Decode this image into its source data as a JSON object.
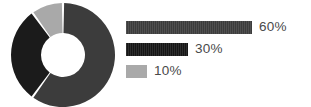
{
  "chart_data": {
    "type": "pie",
    "variant": "donut",
    "title": "",
    "subtitle": "",
    "xlabel": "",
    "ylabel": "",
    "grid": false,
    "legend_position": "right",
    "legend_style": "proportional-bars",
    "categories": [
      "60%",
      "30%",
      "10%"
    ],
    "values": [
      60,
      30,
      10
    ],
    "labels": [
      "60%",
      "30%",
      "10%"
    ],
    "slices": [
      {
        "label": "60%",
        "value": 60,
        "color": "#3c3c3c",
        "start_angle": 0,
        "end_angle": 216
      },
      {
        "label": "30%",
        "value": 30,
        "color": "#1b1b1b",
        "start_angle": 216,
        "end_angle": 324
      },
      {
        "label": "10%",
        "value": 10,
        "color": "#a9a9a9",
        "start_angle": 324,
        "end_angle": 360
      }
    ],
    "total": 100,
    "units": "%",
    "hole_ratio": 0.42,
    "gap_degrees": 2.5
  },
  "donut": {
    "center_x": 52,
    "center_y": 52,
    "outer_radius": 52,
    "inner_radius": 22,
    "background": "#ffffff",
    "segments": [
      {
        "name": "segment-60",
        "value": 60,
        "color": "#3c3c3c"
      },
      {
        "name": "segment-30",
        "value": 30,
        "color": "#1b1b1b"
      },
      {
        "name": "segment-10",
        "value": 10,
        "color": "#a9a9a9"
      }
    ]
  },
  "legend": {
    "rows": [
      {
        "label": "60%",
        "value": 60,
        "bar_width_px": 126,
        "color": "#3c3c3c",
        "textured": true
      },
      {
        "label": "30%",
        "value": 30,
        "bar_width_px": 62,
        "color": "#161616",
        "textured": true
      },
      {
        "label": "10%",
        "value": 10,
        "bar_width_px": 21,
        "color": "#a9a9a9",
        "textured": false
      }
    ]
  },
  "colors": {
    "series_60": "#3c3c3c",
    "series_30": "#1b1b1b",
    "series_10": "#a9a9a9",
    "text": "#4a4a4a",
    "background": "#ffffff"
  }
}
